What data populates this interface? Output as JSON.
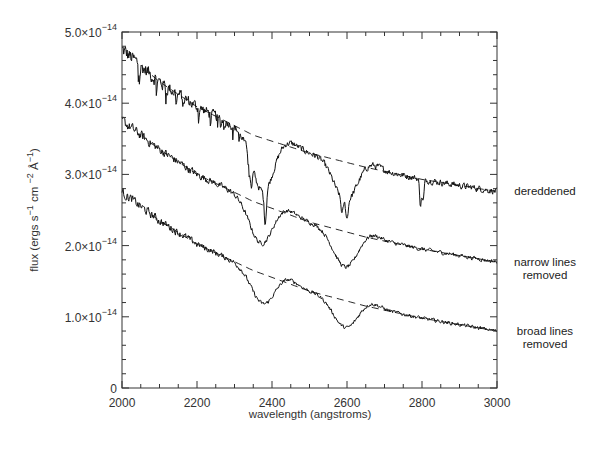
{
  "chart_data": {
    "type": "line",
    "title": "",
    "xlabel": "wavelength (angstroms)",
    "ylabel": "flux (ergs s⁻¹ cm ⁻² Å⁻¹)",
    "xlim": [
      2000,
      3000
    ],
    "ylim": [
      0,
      5e-14
    ],
    "grid": false,
    "legend": "inline labels at right edge",
    "x_ticks": [
      {
        "value": 2000,
        "label": "2000"
      },
      {
        "value": 2200,
        "label": "2200"
      },
      {
        "value": 2400,
        "label": "2400"
      },
      {
        "value": 2600,
        "label": "2600"
      },
      {
        "value": 2800,
        "label": "2800"
      },
      {
        "value": 3000,
        "label": "3000"
      }
    ],
    "y_ticks": [
      {
        "value": 0,
        "mantissa": "0",
        "exponent": ""
      },
      {
        "value": 1.0,
        "mantissa": "1.0×10",
        "exponent": "−14"
      },
      {
        "value": 2.0,
        "mantissa": "2.0×10",
        "exponent": "−14"
      },
      {
        "value": 3.0,
        "mantissa": "3.0×10",
        "exponent": "−14"
      },
      {
        "value": 4.0,
        "mantissa": "4.0×10",
        "exponent": "−14"
      },
      {
        "value": 5.0,
        "mantissa": "5.0×10",
        "exponent": "−14"
      }
    ],
    "y_unit_scale": 1e-14,
    "series": [
      {
        "name": "dereddened",
        "label_lines": [
          "dereddened"
        ],
        "continuum": {
          "x": [
            2000,
            2100,
            2200,
            2350,
            2500,
            2650,
            2800,
            3000
          ],
          "y": [
            4.75,
            4.3,
            3.95,
            3.55,
            3.3,
            3.1,
            2.93,
            2.76
          ]
        },
        "features": [
          {
            "center": 2375,
            "depth": 0.75,
            "width": 28,
            "type": "broad"
          },
          {
            "center": 2595,
            "depth": 0.55,
            "width": 30,
            "type": "broad"
          },
          {
            "center": 2344,
            "depth": 0.35,
            "width": 3,
            "type": "narrow"
          },
          {
            "center": 2382,
            "depth": 0.45,
            "width": 3,
            "type": "narrow"
          },
          {
            "center": 2587,
            "depth": 0.2,
            "width": 3,
            "type": "narrow"
          },
          {
            "center": 2600,
            "depth": 0.25,
            "width": 3,
            "type": "narrow"
          },
          {
            "center": 2796,
            "depth": 0.35,
            "width": 2.5,
            "type": "narrow"
          },
          {
            "center": 2803,
            "depth": 0.3,
            "width": 2.5,
            "type": "narrow"
          }
        ],
        "noise": 0.07,
        "narrow_lines_visible": true
      },
      {
        "name": "narrow lines removed",
        "label_lines": [
          "narrow lines",
          "removed"
        ],
        "continuum": {
          "x": [
            2000,
            2100,
            2200,
            2350,
            2500,
            2650,
            2800,
            3000
          ],
          "y": [
            3.75,
            3.35,
            3.0,
            2.62,
            2.33,
            2.12,
            1.95,
            1.77
          ]
        },
        "features": [
          {
            "center": 2370,
            "depth": 0.55,
            "width": 30,
            "type": "broad"
          },
          {
            "center": 2595,
            "depth": 0.5,
            "width": 32,
            "type": "broad"
          }
        ],
        "noise": 0.045,
        "narrow_lines_visible": false
      },
      {
        "name": "broad lines removed",
        "label_lines": [
          "broad lines",
          "removed"
        ],
        "continuum": {
          "x": [
            2000,
            2100,
            2200,
            2350,
            2500,
            2650,
            2800,
            3000
          ],
          "y": [
            2.75,
            2.35,
            2.02,
            1.65,
            1.36,
            1.15,
            0.98,
            0.8
          ]
        },
        "features": [
          {
            "center": 2375,
            "depth": 0.42,
            "width": 30,
            "type": "broad"
          },
          {
            "center": 2595,
            "depth": 0.38,
            "width": 32,
            "type": "broad"
          }
        ],
        "noise": 0.04,
        "narrow_lines_visible": false
      }
    ],
    "continuum_style": "dashed",
    "annotations": [
      {
        "text": "dereddened",
        "at_y": 2.76
      },
      {
        "text": "narrow lines removed",
        "at_y": 1.77
      },
      {
        "text": "broad lines removed",
        "at_y": 0.8
      }
    ]
  },
  "colors": {
    "line": "#111111",
    "axis": "#333333",
    "text": "#333333",
    "background": "#ffffff"
  }
}
